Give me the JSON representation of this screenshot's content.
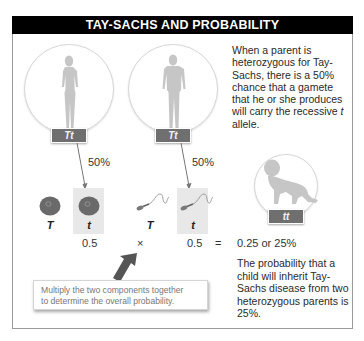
{
  "title": "TAY-SACHS AND PROBABILITY",
  "parents": [
    {
      "role": "mother",
      "icon": "female-silhouette-icon",
      "genotype": "Tt",
      "gamete_chance": "50%"
    },
    {
      "role": "father",
      "icon": "male-silhouette-icon",
      "genotype": "Tt",
      "gamete_chance": "50%"
    }
  ],
  "gametes": {
    "egg": [
      {
        "allele": "T",
        "icon": "egg-cell-icon",
        "highlighted": false
      },
      {
        "allele": "t",
        "icon": "egg-cell-icon",
        "highlighted": true
      }
    ],
    "sperm": [
      {
        "allele": "T",
        "icon": "sperm-cell-icon",
        "highlighted": false
      },
      {
        "allele": "t",
        "icon": "sperm-cell-icon",
        "highlighted": true
      }
    ]
  },
  "child": {
    "icon": "crawling-baby-icon",
    "genotype": "tt"
  },
  "equation": {
    "left": "0.5",
    "operator": "×",
    "right": "0.5",
    "equals": "=",
    "result": "0.25 or 25%"
  },
  "explanations": {
    "top": "When a parent is heterozygous for Tay-Sachs, there is a 50% chance that a gamete that he or she produces will carry the recessive",
    "top_italic": "t",
    "top_end": "allele.",
    "bottom": "The probability that a child will inherit Tay-Sachs disease from two heterozygous parents is 25%."
  },
  "callout": {
    "text_line1": "Multiply the two components together",
    "text_line2": "to determine the overall probability."
  },
  "colors": {
    "title_bg": "#000000",
    "genotype_label": "#6f6f6f",
    "silhouette": "#c6c6c6",
    "egg": "#6a6a6a",
    "highlight": "#e8e8e8",
    "arrow": "#555555"
  }
}
